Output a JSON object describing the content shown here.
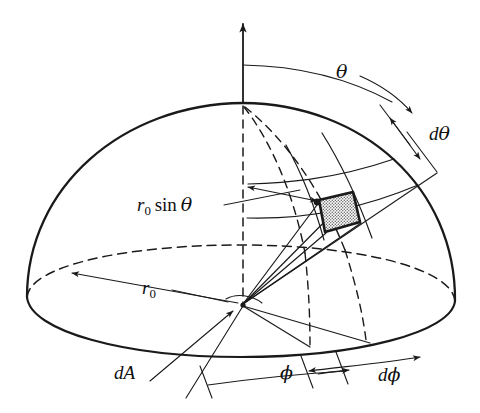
{
  "figure": {
    "background_color": "#ffffff",
    "ink_color": "#1a1a1a",
    "patch_fill_color": "#b9b9b9"
  },
  "labels": {
    "theta": "θ",
    "d_theta_d": "d",
    "d_theta_sym": "θ",
    "r_sin_theta_r": "r",
    "r_sin_theta_sub": "0",
    "r_sin_theta_sin": "sin",
    "r_sin_theta_theta": "θ",
    "r0_r": "r",
    "r0_sub": "0",
    "dA_d": "d",
    "dA_A": "A",
    "phi": "ϕ",
    "d_phi_d": "d",
    "d_phi_sym": "ϕ"
  },
  "geometry": {
    "origin": {
      "x": 243,
      "y": 305
    },
    "apex": {
      "x": 243,
      "y": 103
    },
    "axis_arrow_tip": {
      "x": 243,
      "y": 19
    },
    "base_ellipse": {
      "cx": 241,
      "cy": 300,
      "rx": 214,
      "ry": 56
    },
    "dome_left_edge": {
      "x": 27,
      "y": 297
    },
    "dome_right_edge": {
      "x": 455,
      "y": 301
    },
    "patch_quad": [
      {
        "x": 319,
        "y": 200
      },
      {
        "x": 353,
        "y": 192
      },
      {
        "x": 360,
        "y": 222
      },
      {
        "x": 325,
        "y": 232
      }
    ]
  },
  "elements": {
    "polar_axis": "vertical z-axis with arrowhead",
    "dome_outline": "solid hemispherical dome silhouette",
    "base_rim_front": "solid front half of base circle",
    "base_rim_back": "dashed back half of base circle",
    "center_axis_dashed": "dashed vertical line from apex to origin",
    "meridian_dashed_1": "dashed meridian arc from apex",
    "meridian_dashed_2": "dashed meridian arc from apex",
    "meridian_solid_1": "solid meridian arc through patch left edge",
    "meridian_solid_2": "solid meridian arc through patch right edge",
    "parallel_arc_upper": "solid latitude arc above patch",
    "parallel_arc_lower": "solid latitude arc below patch",
    "theta_arc": "arc from polar axis to dome surface marking theta",
    "dtheta_gap": "double headed arrow between two latitude arcs",
    "phi_arc": "arc along base marking azimuth phi",
    "dphi_gap": "double headed arrow along base marking d phi",
    "r_sin_theta_arrow": "double headed horizontal arrow to dashed axis",
    "r0_arrow": "arrow along base radius to rim",
    "dA_leader": "leader line with arrowhead pointing to the patch region"
  }
}
